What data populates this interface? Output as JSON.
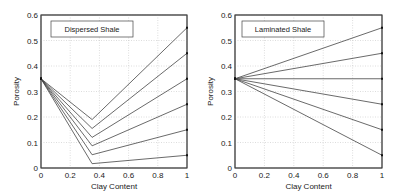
{
  "chart_data": [
    {
      "type": "line",
      "title": "Dispersed Shale",
      "xlabel": "Clay Content",
      "ylabel": "Porosity",
      "xlim": [
        0,
        1
      ],
      "ylim": [
        0,
        0.6
      ],
      "xticks": [
        "0",
        "0.2",
        "0.4",
        "0.6",
        "0.8",
        "1"
      ],
      "yticks": [
        "0",
        "0.1",
        "0.2",
        "0.3",
        "0.4",
        "0.5",
        "0.6"
      ],
      "grid": true,
      "legend_position": "top-left",
      "series": [
        {
          "name": "shale porosity 0.55",
          "x": [
            0,
            0.35,
            1
          ],
          "y": [
            0.35,
            0.19,
            0.55
          ]
        },
        {
          "name": "shale porosity 0.45",
          "x": [
            0,
            0.35,
            1
          ],
          "y": [
            0.35,
            0.155,
            0.45
          ]
        },
        {
          "name": "shale porosity 0.35",
          "x": [
            0,
            0.35,
            1
          ],
          "y": [
            0.35,
            0.12,
            0.35
          ]
        },
        {
          "name": "shale porosity 0.25",
          "x": [
            0,
            0.35,
            1
          ],
          "y": [
            0.35,
            0.087,
            0.25
          ]
        },
        {
          "name": "shale porosity 0.15",
          "x": [
            0,
            0.35,
            1
          ],
          "y": [
            0.35,
            0.052,
            0.15
          ]
        },
        {
          "name": "shale porosity 0.05",
          "x": [
            0,
            0.35,
            1
          ],
          "y": [
            0.35,
            0.017,
            0.05
          ]
        }
      ]
    },
    {
      "type": "line",
      "title": "Laminated Shale",
      "xlabel": "Clay Content",
      "ylabel": "Porosity",
      "xlim": [
        0,
        1
      ],
      "ylim": [
        0,
        0.6
      ],
      "xticks": [
        "0",
        "0.2",
        "0.4",
        "0.6",
        "0.8",
        "1"
      ],
      "yticks": [
        "0",
        "0.1",
        "0.2",
        "0.3",
        "0.4",
        "0.5",
        "0.6"
      ],
      "grid": true,
      "legend_position": "top-left",
      "series": [
        {
          "name": "shale porosity 0.55",
          "x": [
            0,
            1
          ],
          "y": [
            0.35,
            0.55
          ]
        },
        {
          "name": "shale porosity 0.45",
          "x": [
            0,
            1
          ],
          "y": [
            0.35,
            0.45
          ]
        },
        {
          "name": "shale porosity 0.35",
          "x": [
            0,
            1
          ],
          "y": [
            0.35,
            0.35
          ]
        },
        {
          "name": "shale porosity 0.25",
          "x": [
            0,
            1
          ],
          "y": [
            0.35,
            0.25
          ]
        },
        {
          "name": "shale porosity 0.15",
          "x": [
            0,
            1
          ],
          "y": [
            0.35,
            0.15
          ]
        },
        {
          "name": "shale porosity 0.05",
          "x": [
            0,
            1
          ],
          "y": [
            0.35,
            0.05
          ]
        }
      ]
    }
  ]
}
